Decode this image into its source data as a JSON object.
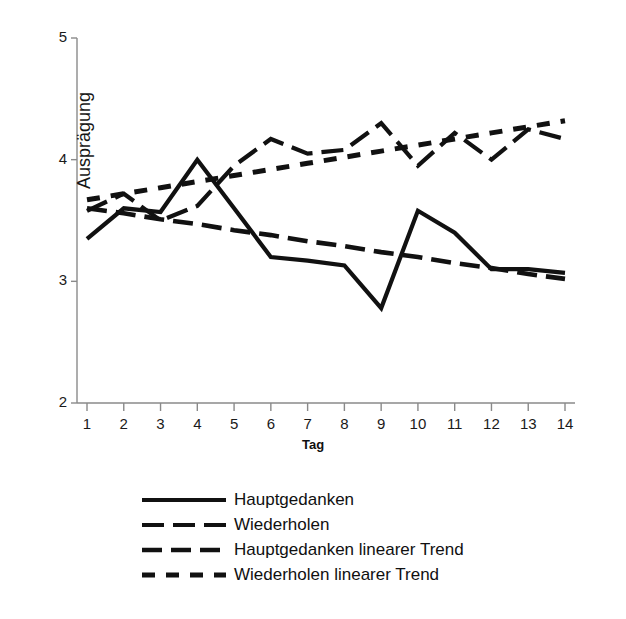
{
  "chart_data": {
    "type": "line",
    "title": "",
    "subtitle": "",
    "xlabel": "Tag",
    "ylabel": "Ausprägung",
    "xlim": [
      1,
      14
    ],
    "ylim": [
      2,
      5
    ],
    "ytick_labels": [
      "5",
      "4",
      "3",
      "2"
    ],
    "ytick_values": [
      5,
      4,
      3,
      2
    ],
    "grid": false,
    "legend_position": "bottom",
    "x": [
      1,
      2,
      3,
      4,
      5,
      6,
      7,
      8,
      9,
      10,
      11,
      12,
      13,
      14
    ],
    "xtick_labels": [
      "1",
      "2",
      "3",
      "4",
      "5",
      "6",
      "7",
      "8",
      "9",
      "10",
      "11",
      "12",
      "13",
      "14"
    ],
    "series": [
      {
        "name": "Hauptgedanken",
        "style": "solid",
        "color": "#111111",
        "values": [
          3.35,
          3.6,
          3.57,
          4.0,
          3.6,
          3.2,
          3.17,
          3.13,
          2.78,
          3.58,
          3.4,
          3.1,
          3.1,
          3.07
        ]
      },
      {
        "name": "Wiederholen",
        "style": "long-dash",
        "color": "#111111",
        "values": [
          3.58,
          3.72,
          3.5,
          3.62,
          3.95,
          4.17,
          4.05,
          4.08,
          4.3,
          3.95,
          4.22,
          4.0,
          4.25,
          4.17
        ]
      },
      {
        "name": "Hauptgedanken linearer Trend",
        "style": "dash-dot",
        "color": "#111111",
        "values": [
          3.6,
          3.56,
          3.51,
          3.47,
          3.42,
          3.38,
          3.33,
          3.29,
          3.24,
          3.2,
          3.15,
          3.11,
          3.06,
          3.02
        ]
      },
      {
        "name": "Wiederholen linearer Trend",
        "style": "dotted",
        "color": "#111111",
        "values": [
          3.67,
          3.72,
          3.77,
          3.82,
          3.87,
          3.92,
          3.97,
          4.02,
          4.07,
          4.12,
          4.17,
          4.22,
          4.27,
          4.32
        ]
      }
    ],
    "legend": [
      "Hauptgedanken",
      "Wiederholen",
      "Hauptgedanken linearer Trend",
      "Wiederholen linearer Trend"
    ]
  }
}
